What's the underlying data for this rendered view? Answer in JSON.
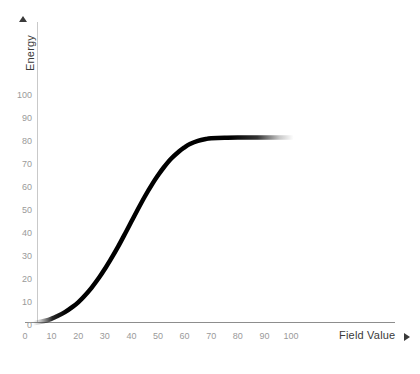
{
  "chart_data": {
    "type": "line",
    "title": "",
    "xlabel": "Field Value",
    "ylabel": "Energy",
    "xlim": [
      0,
      105
    ],
    "ylim": [
      0,
      105
    ],
    "grid": false,
    "legend": null,
    "xticks": [
      0,
      10,
      20,
      30,
      40,
      50,
      60,
      70,
      80,
      90,
      100
    ],
    "xtick_labels": [
      "0",
      "10",
      "20",
      "30",
      "40",
      "50",
      "60",
      "70",
      "80",
      "90",
      "100"
    ],
    "yticks": [
      0,
      10,
      20,
      30,
      40,
      50,
      60,
      70,
      80,
      90,
      100
    ],
    "ytick_labels": [
      "0",
      "10",
      "20",
      "30",
      "40",
      "50",
      "60",
      "70",
      "80",
      "90",
      "100"
    ],
    "series": [
      {
        "name": "Energy",
        "color": "#000000",
        "linewidth": 4.5,
        "fade_ends": true,
        "x": [
          3,
          5,
          8,
          10,
          12,
          15,
          18,
          20,
          22,
          25,
          28,
          30,
          32,
          35,
          38,
          40,
          42,
          45,
          48,
          50,
          52,
          55,
          58,
          60,
          62,
          65,
          68,
          70,
          75,
          80,
          85,
          90,
          95,
          100,
          101
        ],
        "y": [
          1.2,
          1.6,
          2.4,
          3.2,
          4.2,
          6.0,
          8.4,
          10.3,
          12.6,
          16.6,
          21.3,
          24.8,
          28.5,
          34.5,
          41.0,
          45.4,
          49.8,
          56.2,
          62.0,
          65.5,
          68.7,
          72.8,
          76.0,
          77.7,
          79.1,
          80.5,
          81.3,
          81.6,
          81.9,
          82.0,
          82.0,
          82.0,
          82.0,
          82.0,
          82.0
        ]
      }
    ]
  },
  "axes": {
    "y_title": "Energy",
    "x_title": "Field Value",
    "y_arrow_glyph": "triangle-up",
    "x_arrow_glyph": "triangle-right"
  },
  "colors": {
    "background": "#ffffff",
    "curve": "#000000",
    "axis": "#8d8d8d",
    "y_axis": "#c9c9c9",
    "tick_text": "#9a9a9a",
    "title_text": "#3a3a3a"
  }
}
